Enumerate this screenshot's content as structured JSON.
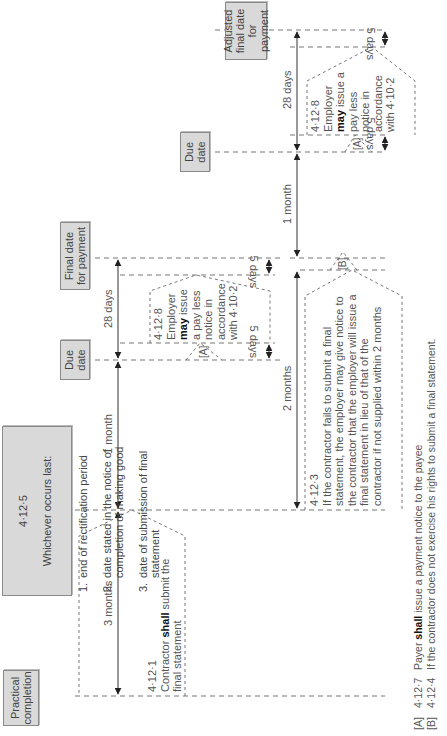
{
  "boxes": {
    "practical_completion": "Practical\ncompletion",
    "clause_4_12_5": {
      "ref": "4·12·5",
      "heading": "Whichever occurs last:",
      "items": [
        {
          "n": "1.",
          "text": "end of rectification period"
        },
        {
          "n": "2.",
          "text": "date stated in the notice of completion of making good"
        },
        {
          "n": "3.",
          "text": "date of submission of final statement"
        }
      ]
    },
    "due_date_1": "Due\ndate",
    "final_date": "Final date\nfor payment",
    "due_date_2": "Due\ndate",
    "adjusted_final_date": "Adjusted\nfinal date\nfor payment"
  },
  "durations": {
    "three_months": "3 months",
    "one_month_a": "1 month",
    "twenty_eight_days_a": "28 days",
    "five_days_a1": "5 days",
    "five_days_a2": "5 days",
    "two_months": "2 months",
    "one_month_b": "1 month",
    "twenty_eight_days_b": "28 days",
    "five_days_b1": "5 days",
    "five_days_b2": "5 days"
  },
  "notes": {
    "n_4_12_1": {
      "ref": "4·12·1",
      "pre": "Contractor ",
      "bold": "shall",
      "post": " submit the final statement"
    },
    "n_4_12_8_a": {
      "ref": "4·12·8",
      "line1": "Employer",
      "bold": "may",
      "post": " issue a pay less notice in accordance with 4·10·2"
    },
    "n_4_12_8_b": {
      "ref": "4·12·8",
      "line1": "Employer",
      "bold": "may",
      "post": " issue a pay less notice in accordance with 4·10·2"
    },
    "n_4_12_3": {
      "ref": "4·12·3",
      "text": "If the contractor fails to submit a final statement, the employer may give notice to the contractor that the employer will issue a final statement in lieu of that of the contractor if not supplied within 2 months"
    }
  },
  "markers": {
    "a1": "[A]",
    "a2": "[A]",
    "b": "[B]"
  },
  "legend": [
    {
      "key": "[A]",
      "clause": "4·12·7",
      "pre": "Payer ",
      "bold": "shall",
      "post": " issue a payment notice to the payee"
    },
    {
      "key": "[B]",
      "clause": "4·12·4",
      "pre": "",
      "bold": "",
      "post": "If the contractor does not exercise his rights to submit a final statement."
    }
  ],
  "colors": {
    "box_fill": "#d9d9d9",
    "line": "#555555",
    "dash": "#777777"
  }
}
